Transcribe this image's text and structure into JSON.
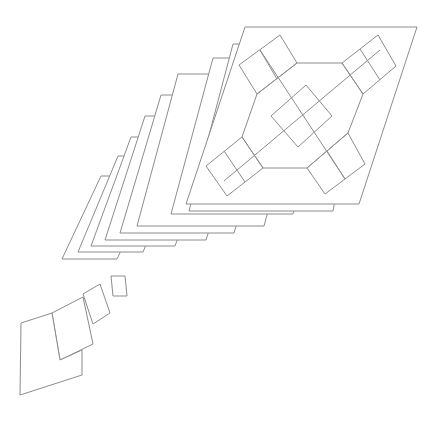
{
  "diagram": {
    "width": 439,
    "height": 422,
    "background": "#ffffff",
    "stroke_color": "#8c8c8c",
    "stack_layers": [
      {
        "name": "layer-7",
        "points": [
          [
            101,
            176
          ],
          [
            156,
            176
          ],
          [
            117,
            259
          ],
          [
            62,
            259
          ]
        ]
      },
      {
        "name": "layer-6",
        "points": [
          [
            118,
            156
          ],
          [
            183,
            156
          ],
          [
            143,
            252
          ],
          [
            78,
            252
          ]
        ]
      },
      {
        "name": "layer-5",
        "points": [
          [
            131,
            137
          ],
          [
            215,
            137
          ],
          [
            175,
            246
          ],
          [
            91,
            246
          ]
        ]
      },
      {
        "name": "layer-4",
        "points": [
          [
            145,
            116
          ],
          [
            246,
            116
          ],
          [
            206,
            240
          ],
          [
            105,
            240
          ]
        ]
      },
      {
        "name": "layer-3",
        "points": [
          [
            161,
            95
          ],
          [
            275,
            95
          ],
          [
            234,
            233
          ],
          [
            120,
            233
          ]
        ]
      },
      {
        "name": "layer-2",
        "points": [
          [
            178,
            74
          ],
          [
            305,
            74
          ],
          [
            264,
            226
          ],
          [
            137,
            226
          ]
        ]
      },
      {
        "name": "layer-1",
        "points": [
          [
            213,
            58
          ],
          [
            335,
            58
          ],
          [
            293,
            214
          ],
          [
            171,
            214
          ]
        ]
      },
      {
        "name": "layer-0",
        "points": [
          [
            233,
            44
          ],
          [
            362,
            44
          ],
          [
            333,
            211
          ],
          [
            189,
            211
          ]
        ]
      }
    ],
    "front_panel": {
      "name": "front-panel",
      "points": [
        [
          245,
          27
        ],
        [
          417,
          27
        ],
        [
          359,
          204
        ],
        [
          186,
          204
        ]
      ]
    },
    "pattern": {
      "hexagon": [
        [
          297,
          63
        ],
        [
          342,
          63
        ],
        [
          363,
          94
        ],
        [
          348,
          133
        ],
        [
          307,
          168
        ],
        [
          263,
          168
        ],
        [
          242,
          137
        ],
        [
          257,
          94
        ]
      ],
      "center_square": [
        [
          271,
          116
        ],
        [
          306,
          85
        ],
        [
          332,
          116
        ],
        [
          298,
          147
        ]
      ],
      "arms": [
        {
          "name": "arm-top-left",
          "outer": [
            [
              239,
              65
            ],
            [
              280,
              35
            ],
            [
              297,
              63
            ],
            [
              257,
              94
            ]
          ],
          "divider": [
            [
              260,
              50
            ],
            [
              277,
              79
            ]
          ]
        },
        {
          "name": "arm-top-right",
          "outer": [
            [
              342,
              63
            ],
            [
              378,
              35
            ],
            [
              396,
              66
            ],
            [
              363,
              94
            ]
          ],
          "divider": [
            [
              360,
              49
            ],
            [
              380,
              80
            ]
          ]
        },
        {
          "name": "arm-bottom-left",
          "outer": [
            [
              206,
              166
            ],
            [
              242,
              137
            ],
            [
              263,
              168
            ],
            [
              227,
              196
            ]
          ],
          "divider": [
            [
              224,
              151
            ],
            [
              245,
              182
            ]
          ]
        },
        {
          "name": "arm-bottom-right",
          "outer": [
            [
              307,
              168
            ],
            [
              348,
              133
            ],
            [
              365,
              164
            ],
            [
              325,
              194
            ]
          ],
          "divider": [
            [
              327,
              151
            ],
            [
              345,
              179
            ]
          ]
        }
      ],
      "diagonal_lines": [
        {
          "name": "diag-long-a",
          "points": [
            [
              260,
              50
            ],
            [
              345,
              179
            ]
          ]
        },
        {
          "name": "diag-long-b",
          "points": [
            [
              380,
              50
            ],
            [
              224,
              181
            ]
          ]
        }
      ]
    },
    "scattered_shapes": [
      {
        "name": "small-diamond",
        "points": [
          [
            111,
            276
          ],
          [
            125,
            276
          ],
          [
            127,
            296
          ],
          [
            113,
            296
          ]
        ]
      },
      {
        "name": "small-tilted-card",
        "points": [
          [
            83,
            294
          ],
          [
            100,
            284
          ],
          [
            110,
            313
          ],
          [
            93,
            324
          ]
        ]
      },
      {
        "name": "medium-card",
        "points": [
          [
            52,
            313
          ],
          [
            83,
            297
          ],
          [
            93,
            344
          ],
          [
            60,
            360
          ]
        ]
      },
      {
        "name": "large-card",
        "points": [
          [
            21,
            323
          ],
          [
            52,
            313
          ],
          [
            60,
            360
          ],
          [
            82,
            350
          ],
          [
            82,
            375
          ],
          [
            20,
            395
          ]
        ]
      }
    ]
  }
}
